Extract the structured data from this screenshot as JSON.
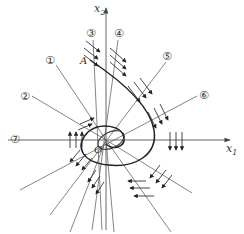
{
  "diagram": {
    "axes": {
      "x_label": "x",
      "x_sub": "1",
      "y_label": "x",
      "y_sub": "2",
      "origin_label": "O"
    },
    "point_label": "A",
    "isoclines": [
      {
        "id": 1,
        "label": "①"
      },
      {
        "id": 2,
        "label": "②"
      },
      {
        "id": 3,
        "label": "③"
      },
      {
        "id": 4,
        "label": "④"
      },
      {
        "id": 5,
        "label": "⑤"
      },
      {
        "id": 6,
        "label": "⑥"
      },
      {
        "id": 7,
        "label": "⑦"
      }
    ],
    "colors": {
      "line": "#555555",
      "trajectory": "#222222",
      "text": "#333333"
    }
  }
}
